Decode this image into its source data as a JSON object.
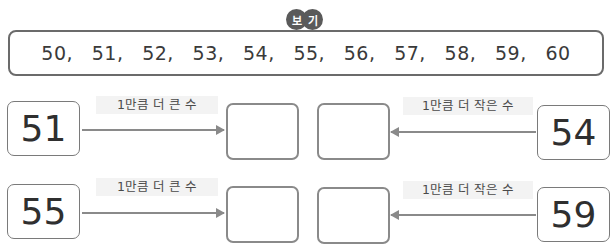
{
  "example": {
    "badge": [
      "보",
      "기"
    ],
    "numbers": [
      "50,",
      "51,",
      "52,",
      "53,",
      "54,",
      "55,",
      "56,",
      "57,",
      "58,",
      "59,",
      "60"
    ]
  },
  "rows": [
    {
      "left": {
        "given": "51",
        "label": "1만큼 더 큰 수"
      },
      "right": {
        "given": "54",
        "label": "1만큼 더 작은 수"
      }
    },
    {
      "left": {
        "given": "55",
        "label": "1만큼 더 큰 수"
      },
      "right": {
        "given": "59",
        "label": "1만큼 더 작은 수"
      }
    }
  ]
}
